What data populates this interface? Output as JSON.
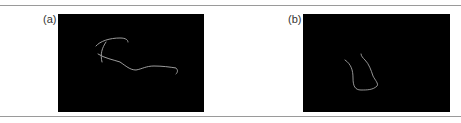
{
  "figure": {
    "panels": [
      {
        "id": "a",
        "label": "(a)",
        "description": "binary edge map of a dog silhouette on black background"
      },
      {
        "id": "b",
        "label": "(b)",
        "description": "binary edge map of a cup-like contour on black background"
      }
    ],
    "colors": {
      "background": "#000000",
      "edge": "#b8b8b8",
      "rule": "#9a9a9a"
    }
  }
}
